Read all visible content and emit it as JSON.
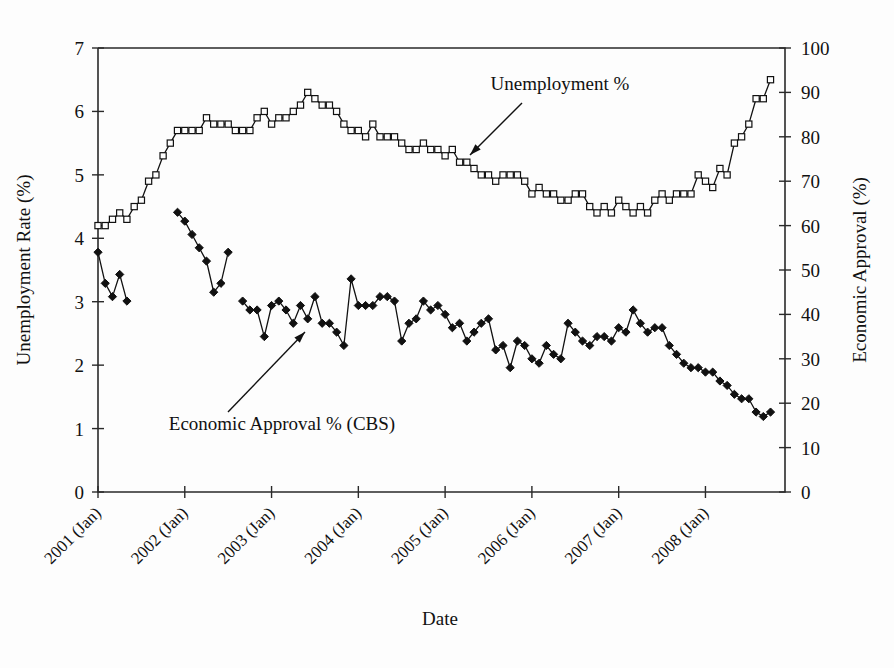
{
  "chart_data": {
    "type": "line",
    "title": "",
    "xlabel": "Date",
    "ylabel": "Unemployment Rate (%)",
    "y2label": "Economic Approval (%)",
    "ylim": [
      0,
      7
    ],
    "y2lim": [
      0,
      100
    ],
    "ytick_labels": [
      "0",
      "1",
      "2",
      "3",
      "4",
      "5",
      "6",
      "7"
    ],
    "ytick_values": [
      0,
      1,
      2,
      3,
      4,
      5,
      6,
      7
    ],
    "y2tick_labels": [
      "0",
      "10",
      "20",
      "30",
      "40",
      "50",
      "60",
      "70",
      "80",
      "90",
      "100"
    ],
    "y2tick_values": [
      0,
      10,
      20,
      30,
      40,
      50,
      60,
      70,
      80,
      90,
      100
    ],
    "xtick_labels": [
      "2001 (Jan)",
      "2002 (Jan)",
      "2003 (Jan)",
      "2004 (Jan)",
      "2005 (Jan)",
      "2006 (Jan)",
      "2007 (Jan)",
      "2008 (Jan)"
    ],
    "xtick_values": [
      0,
      12,
      24,
      36,
      48,
      60,
      72,
      84
    ],
    "xlim": [
      0,
      95
    ],
    "grid": false,
    "legend_position": "inline-annotations",
    "annotations": [
      {
        "text": "Unemployment %",
        "text_x": 560,
        "text_y": 90,
        "arrow_from_x": 522,
        "arrow_from_y": 103,
        "arrow_to_x": 470,
        "arrow_to_y": 155
      },
      {
        "text": "Economic Approval  % (CBS)",
        "text_x": 282,
        "text_y": 430,
        "arrow_from_x": 228,
        "arrow_from_y": 412,
        "arrow_to_x": 305,
        "arrow_to_y": 332
      }
    ],
    "series": [
      {
        "name": "Unemployment %",
        "axis": "left",
        "marker": "open-square",
        "units": "percent",
        "values": [
          4.2,
          4.2,
          4.3,
          4.4,
          4.3,
          4.5,
          4.6,
          4.9,
          5.0,
          5.3,
          5.5,
          5.7,
          5.7,
          5.7,
          5.7,
          5.9,
          5.8,
          5.8,
          5.8,
          5.7,
          5.7,
          5.7,
          5.9,
          6.0,
          5.8,
          5.9,
          5.9,
          6.0,
          6.1,
          6.3,
          6.2,
          6.1,
          6.1,
          6.0,
          5.8,
          5.7,
          5.7,
          5.6,
          5.8,
          5.6,
          5.6,
          5.6,
          5.5,
          5.4,
          5.4,
          5.5,
          5.4,
          5.4,
          5.3,
          5.4,
          5.2,
          5.2,
          5.1,
          5.0,
          5.0,
          4.9,
          5.0,
          5.0,
          5.0,
          4.9,
          4.7,
          4.8,
          4.7,
          4.7,
          4.6,
          4.6,
          4.7,
          4.7,
          4.5,
          4.4,
          4.5,
          4.4,
          4.6,
          4.5,
          4.4,
          4.5,
          4.4,
          4.6,
          4.7,
          4.6,
          4.7,
          4.7,
          4.7,
          5.0,
          4.9,
          4.8,
          5.1,
          5.0,
          5.5,
          5.6,
          5.8,
          6.2,
          6.2,
          6.5
        ]
      },
      {
        "name": "Economic Approval % (CBS)",
        "axis": "right",
        "marker": "filled-diamond",
        "units": "percent",
        "values": [
          54,
          47,
          44,
          49,
          43,
          null,
          null,
          null,
          null,
          null,
          null,
          63,
          61,
          58,
          55,
          52,
          45,
          47,
          54,
          null,
          43,
          41,
          41,
          35,
          42,
          43,
          41,
          38,
          42,
          39,
          44,
          38,
          38,
          36,
          33,
          48,
          42,
          42,
          42,
          44,
          44,
          43,
          34,
          38,
          39,
          43,
          41,
          42,
          40,
          37,
          38,
          34,
          36,
          38,
          39,
          32,
          33,
          28,
          34,
          33,
          30,
          29,
          33,
          31,
          30,
          38,
          36,
          34,
          33,
          35,
          35,
          34,
          37,
          36,
          41,
          38,
          36,
          37,
          37,
          33,
          31,
          29,
          28,
          28,
          27,
          27,
          25,
          24,
          22,
          21,
          21,
          18,
          17,
          18
        ]
      }
    ]
  },
  "axes": {
    "left_title": "Unemployment Rate (%)",
    "right_title": "Economic Approval (%)",
    "bottom_title": "Date"
  },
  "annotations": {
    "unemployment_label": "Unemployment %",
    "approval_label": "Economic Approval  % (CBS)"
  },
  "colors": {
    "ink": "#111111",
    "background": "#fdfdfd",
    "frame": "#2a2a2a"
  }
}
